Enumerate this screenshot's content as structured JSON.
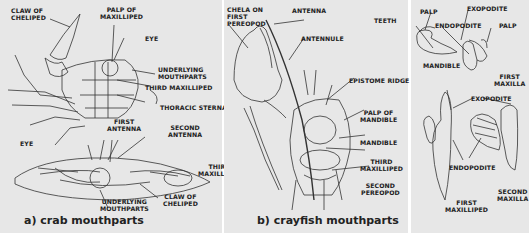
{
  "panels": {
    "crab": {
      "caption": "a) crab mouthparts",
      "labels": {
        "claw_top_1": "CLAW OF",
        "claw_top_2": "CHELIPED",
        "palp_1": "PALP OF",
        "palp_2": "MAXILLIPED",
        "eye_top": "EYE",
        "under_top_1": "UNDERLYING",
        "under_top_2": "MOUTHPARTS",
        "third_max_top": "THIRD MAXILLIPED",
        "thoracic": "THORACIC STERNA",
        "first_ant_1": "FIRST",
        "first_ant_2": "ANTENNA",
        "second_ant_1": "SECOND",
        "second_ant_2": "ANTENNA",
        "eye_bottom": "EYE",
        "third_max_b_1": "THIRD",
        "third_max_b_2": "MAXILLIPED",
        "under_b_1": "UNDERLYING",
        "under_b_2": "MOUTHPARTS",
        "claw_b_1": "CLAW OF",
        "claw_b_2": "CHELIPED"
      }
    },
    "crayfish": {
      "caption": "b) crayfish mouthparts",
      "labels": {
        "chela_1": "CHELA ON",
        "chela_2": "FIRST",
        "chela_3": "PEREOPOD",
        "antenna": "ANTENNA",
        "antennule": "ANTENNULE",
        "epistome": "EPISTOME RIDGE",
        "palp_mand_1": "PALP OF",
        "palp_mand_2": "MANDIBLE",
        "mandible": "MANDIBLE",
        "third_max_1": "THIRD",
        "third_max_2": "MAXILLIPED",
        "second_per_1": "SECOND",
        "second_per_2": "PEREOPOD",
        "teeth": "TEETH"
      }
    },
    "appendages": {
      "labels": {
        "palp": "PALP",
        "mandible": "MANDIBLE",
        "exopodite_top": "EXOPODITE",
        "endopodite_top": "ENDOPODITE",
        "palp_right": "PALP",
        "first_maxilla_1": "FIRST",
        "first_maxilla_2": "MAXILLA",
        "exopodite_b": "EXOPODITE",
        "endopodite_b": "ENDOPODITE",
        "first_maxilliped_1": "FIRST",
        "first_maxilliped_2": "MAXILLIPED",
        "second_maxilla_1": "SECOND",
        "second_maxilla_2": "MAXILLA"
      }
    }
  }
}
